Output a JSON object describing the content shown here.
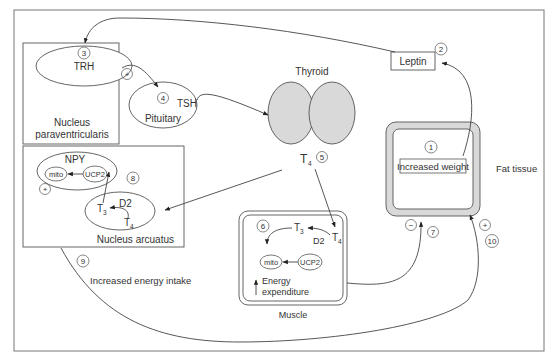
{
  "diagram": {
    "type": "physiological pathway",
    "nodes": {
      "nucleus_paraventricularis": {
        "label_line1": "Nucleus",
        "label_line2": "paraventricularis"
      },
      "trh": {
        "label": "TRH",
        "step": "3"
      },
      "pituitary": {
        "label": "Pituitary",
        "hormone": "TSH",
        "step": "4"
      },
      "thyroid": {
        "label": "Thyroid"
      },
      "t4_output": {
        "label": "T",
        "subscript": "4",
        "step": "5"
      },
      "leptin": {
        "label": "Leptin",
        "step": "2"
      },
      "fat_tissue": {
        "label": "Fat tissue",
        "inner_label": "Increased weight",
        "step": "1"
      },
      "nucleus_arcuatus": {
        "label": "Nucleus arcuatus",
        "step": "8",
        "npy": "NPY",
        "mito": "mito",
        "ucp2": "UCP2",
        "t3": "T",
        "t3_sub": "3",
        "d2": "D2",
        "t4": "T",
        "t4_sub": "4",
        "sign": "+"
      },
      "muscle": {
        "label": "Muscle",
        "step": "6",
        "t3": "T",
        "t3_sub": "3",
        "t4": "T",
        "t4_sub": "4",
        "d2": "D2",
        "mito": "mito",
        "ucp2": "UCP2",
        "energy_line1": "Energy",
        "energy_line2": "expenditure"
      }
    },
    "edges": {
      "trh_to_pituitary_sign": "+",
      "muscle_to_fat_sign": "−",
      "muscle_to_fat_step": "7",
      "intake_to_fat_sign": "+",
      "intake_to_fat_step": "10",
      "intake_step": "9",
      "intake_label": "Increased energy intake"
    },
    "colors": {
      "line": "#444444",
      "fill_gray": "#d9d9d9",
      "text": "#333333"
    }
  }
}
